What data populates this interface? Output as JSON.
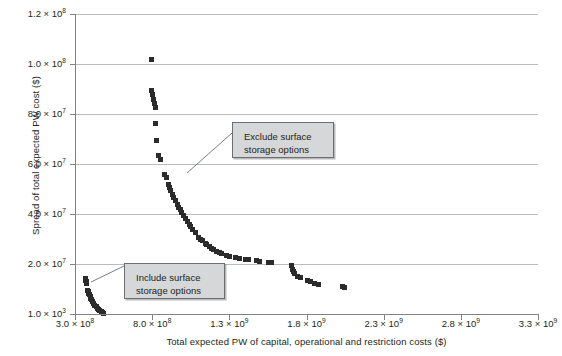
{
  "chart_data": {
    "type": "scatter",
    "title": "",
    "xlabel": "Total expected PW of capital, operational and restriction costs ($)",
    "ylabel": "Spread of total expected PW cost ($)",
    "xlim": [
      300000000,
      3300000000
    ],
    "ylim": [
      1000,
      120000000
    ],
    "grid": true,
    "legend": null,
    "xticks": [
      {
        "value": 300000000,
        "label_mantissa": "3.0 × 10",
        "label_exp": "8"
      },
      {
        "value": 800000000,
        "label_mantissa": "8.0 × 10",
        "label_exp": "8"
      },
      {
        "value": 1300000000,
        "label_mantissa": "1.3 × 10",
        "label_exp": "9"
      },
      {
        "value": 1800000000,
        "label_mantissa": "1.8 × 10",
        "label_exp": "9"
      },
      {
        "value": 2300000000,
        "label_mantissa": "2.3 × 10",
        "label_exp": "9"
      },
      {
        "value": 2800000000,
        "label_mantissa": "2.8 × 10",
        "label_exp": "9"
      },
      {
        "value": 3300000000,
        "label_mantissa": "3.3 × 10",
        "label_exp": "9"
      }
    ],
    "yticks": [
      {
        "value": 120000000,
        "label_mantissa": "1.2 × 10",
        "label_exp": "8"
      },
      {
        "value": 100000000,
        "label_mantissa": "1.0 × 10",
        "label_exp": "8"
      },
      {
        "value": 80000000,
        "label_mantissa": "8.0 × 10",
        "label_exp": "7"
      },
      {
        "value": 60000000,
        "label_mantissa": "6.0 × 10",
        "label_exp": "7"
      },
      {
        "value": 40000000,
        "label_mantissa": "4.0 × 10",
        "label_exp": "7"
      },
      {
        "value": 20000000,
        "label_mantissa": "2.0 × 10",
        "label_exp": "7"
      },
      {
        "value": 1000,
        "label_mantissa": "1.0 × 10",
        "label_exp": "3"
      }
    ],
    "series": [
      {
        "name": "Include surface storage options",
        "points": [
          [
            362000000.0,
            14500000.0
          ],
          [
            364000000.0,
            14000000.0
          ],
          [
            366000000.0,
            13600000.0
          ],
          [
            369000000.0,
            13100000.0
          ],
          [
            372000000.0,
            12600000.0
          ],
          [
            378000000.0,
            9800000.0
          ],
          [
            382000000.0,
            9200000.0
          ],
          [
            386000000.0,
            8600000.0
          ],
          [
            390000000.0,
            8000000.0
          ],
          [
            395000000.0,
            7300000.0
          ],
          [
            400000000.0,
            6600000.0
          ],
          [
            406000000.0,
            5900000.0
          ],
          [
            412000000.0,
            5200000.0
          ],
          [
            419000000.0,
            4500000.0
          ],
          [
            426000000.0,
            3800000.0
          ],
          [
            434000000.0,
            3100000.0
          ],
          [
            442000000.0,
            2500000.0
          ],
          [
            450000000.0,
            2000000.0
          ],
          [
            458000000.0,
            1500000.0
          ],
          [
            466000000.0,
            1100000.0
          ],
          [
            474000000.0,
            800000.0
          ],
          [
            482000000.0,
            500000.0
          ]
        ]
      },
      {
        "name": "Exclude surface storage options",
        "points": [
          [
            795000000.0,
            102000000.0
          ],
          [
            795000000.0,
            89500000.0
          ],
          [
            802000000.0,
            88000000.0
          ],
          [
            808000000.0,
            86200000.0
          ],
          [
            814000000.0,
            84500000.0
          ],
          [
            818000000.0,
            82800000.0
          ],
          [
            818000000.0,
            76500000.0
          ],
          [
            825000000.0,
            69800000.0
          ],
          [
            840000000.0,
            63800000.0
          ],
          [
            848000000.0,
            62200000.0
          ],
          [
            878000000.0,
            56000000.0
          ],
          [
            888000000.0,
            54800000.0
          ],
          [
            900000000.0,
            52000000.0
          ],
          [
            908000000.0,
            50800000.0
          ],
          [
            916000000.0,
            49600000.0
          ],
          [
            928000000.0,
            48000000.0
          ],
          [
            938000000.0,
            47000000.0
          ],
          [
            948000000.0,
            45800000.0
          ],
          [
            960000000.0,
            44200000.0
          ],
          [
            970000000.0,
            43000000.0
          ],
          [
            980000000.0,
            42000000.0
          ],
          [
            990000000.0,
            41000000.0
          ],
          [
            1000000000.0,
            39800000.0
          ],
          [
            1012000000.0,
            38600000.0
          ],
          [
            1024000000.0,
            37400000.0
          ],
          [
            1036000000.0,
            36200000.0
          ],
          [
            1048000000.0,
            35200000.0
          ],
          [
            1060000000.0,
            34200000.0
          ],
          [
            1076000000.0,
            32800000.0
          ],
          [
            1100000000.0,
            31000000.0
          ],
          [
            1112000000.0,
            30200000.0
          ],
          [
            1124000000.0,
            29600000.0
          ],
          [
            1140000000.0,
            28600000.0
          ],
          [
            1152000000.0,
            28000000.0
          ],
          [
            1166000000.0,
            27200000.0
          ],
          [
            1180000000.0,
            26600000.0
          ],
          [
            1196000000.0,
            26000000.0
          ],
          [
            1212000000.0,
            25400000.0
          ],
          [
            1230000000.0,
            24800000.0
          ],
          [
            1248000000.0,
            24400000.0
          ],
          [
            1280000000.0,
            23800000.0
          ],
          [
            1300000000.0,
            23400000.0
          ],
          [
            1336000000.0,
            22800000.0
          ],
          [
            1360000000.0,
            22600000.0
          ],
          [
            1400000000.0,
            22200000.0
          ],
          [
            1424000000.0,
            22000000.0
          ],
          [
            1470000000.0,
            21600000.0
          ],
          [
            1494000000.0,
            21400000.0
          ],
          [
            1548000000.0,
            21000000.0
          ],
          [
            1572000000.0,
            20800000.0
          ],
          [
            1700000000.0,
            19600000.0
          ],
          [
            1704000000.0,
            18000000.0
          ],
          [
            1712000000.0,
            17200000.0
          ],
          [
            1722000000.0,
            16400000.0
          ],
          [
            1740000000.0,
            15400000.0
          ],
          [
            1756000000.0,
            14800000.0
          ],
          [
            1800000000.0,
            13800000.0
          ],
          [
            1820000000.0,
            13400000.0
          ],
          [
            1850000000.0,
            12600000.0
          ],
          [
            1872000000.0,
            12200000.0
          ],
          [
            2030000000.0,
            11400000.0
          ],
          [
            2046000000.0,
            10800000.0
          ]
        ]
      }
    ],
    "annotations": [
      {
        "id": "exclude-callout",
        "text": "Exclude surface\nstorage options",
        "box_left": 232,
        "box_top": 122,
        "box_width": 102,
        "box_height": 36,
        "leader_from": [
          232,
          133
        ],
        "leader_to": [
          187,
          173
        ]
      },
      {
        "id": "include-callout",
        "text": "Include surface\nstorage options",
        "box_left": 124,
        "box_top": 263,
        "box_width": 101,
        "box_height": 36,
        "leader_from": [
          124,
          266
        ],
        "leader_to": [
          91,
          282
        ]
      }
    ]
  },
  "colors": {
    "marker": "#2b2b2b",
    "gridline": "#b9bcbf",
    "axis": "#808285",
    "callout_fill": "#d6d7d8",
    "callout_border": "#6d6e71",
    "text": "#231f20",
    "background": "#ffffff"
  }
}
